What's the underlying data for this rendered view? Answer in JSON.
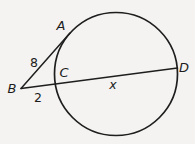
{
  "figure": {
    "kind": "circle-tangent-secant-diagram",
    "labels": {
      "point_a": "A",
      "point_b": "B",
      "point_c": "C",
      "point_d": "D",
      "tangent_ba_length": "8",
      "external_segment_bc": "2",
      "chord_cd": "x"
    }
  },
  "colors": {
    "background": "#f4f3f1",
    "stroke": "#1e1e1e",
    "text": "#1c1c1c"
  }
}
